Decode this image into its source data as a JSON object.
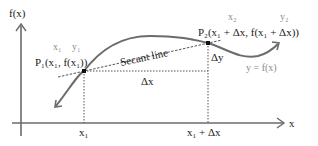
{
  "diagram": {
    "axes": {
      "y_label": "f(x)",
      "x_label": "x"
    },
    "curve_label": "y = f(x)",
    "secant_label": "Secant line",
    "point1": {
      "label": "P₁(x₁, f(x₁))",
      "annot_x": "x₁",
      "annot_y": "y₁"
    },
    "point2": {
      "label": "P₂(x₁ + Δx, f(x₁ + Δx))",
      "annot_x": "x₂",
      "annot_y": "y₂"
    },
    "delta_x": "Δx",
    "delta_y": "Δy",
    "x_ticks": [
      "x₁",
      "x₁ + Δx"
    ],
    "colors": {
      "curve": "#6b6b6b",
      "axis": "#6b6b6b",
      "text": "#222222",
      "annotation": "#8a8a8a"
    }
  }
}
